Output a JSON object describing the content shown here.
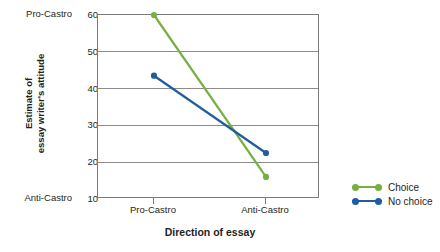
{
  "chart_data": {
    "type": "line",
    "title": "",
    "xlabel": "Direction of essay",
    "ylabel": "Estimate of essay writer's attitude",
    "ylabel_lines": [
      "Estimate of",
      "essay writer's attitude"
    ],
    "categories": [
      "Pro-Castro",
      "Anti-Castro"
    ],
    "x": [
      0,
      1
    ],
    "ylim": [
      10,
      60
    ],
    "yticks": [
      60,
      50,
      40,
      30,
      20,
      10
    ],
    "ytick_labels": [
      "60",
      "50",
      "40",
      "30",
      "20",
      "10"
    ],
    "y_axis_endpoint_labels": {
      "top": "Pro-Castro",
      "bottom": "Anti-Castro"
    },
    "grid": "horizontal",
    "legend_position": "right",
    "series": [
      {
        "name": "Choice",
        "color": "#76b043",
        "values": [
          60,
          16
        ]
      },
      {
        "name": "No choice",
        "color": "#1f5da0",
        "values": [
          43.5,
          22.5
        ]
      }
    ]
  },
  "axis": {
    "y_top_category": "Pro-Castro",
    "y_bottom_category": "Anti-Castro",
    "y_title_line1": "Estimate of",
    "y_title_line2": "essay writer's attitude",
    "x_title": "Direction of essay",
    "x_cat_1": "Pro-Castro",
    "x_cat_2": "Anti-Castro",
    "ytick_60": "60",
    "ytick_50": "50",
    "ytick_40": "40",
    "ytick_30": "30",
    "ytick_20": "20",
    "ytick_10": "10"
  },
  "legend": {
    "items": [
      {
        "label": "Choice",
        "color": "#76b043"
      },
      {
        "label": "No choice",
        "color": "#1f5da0"
      }
    ]
  },
  "colors": {
    "choice": "#76b043",
    "no_choice": "#1f5da0",
    "axis": "#7b7b7b",
    "grid": "#8c8c8c",
    "text": "#231f20"
  }
}
